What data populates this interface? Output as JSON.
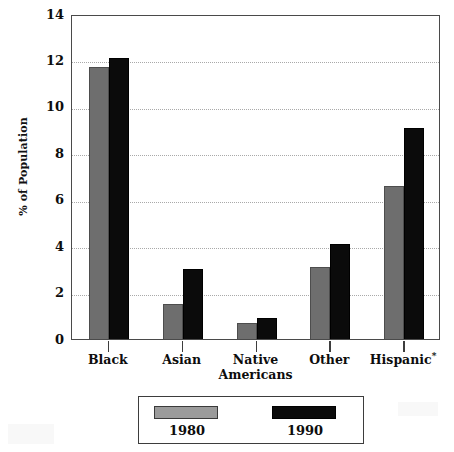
{
  "chart_data": {
    "type": "bar",
    "title": "",
    "xlabel": "",
    "ylabel": "% of Population",
    "ylim": [
      0,
      14
    ],
    "yticks": [
      0,
      2,
      4,
      6,
      8,
      10,
      12,
      14
    ],
    "ytick_labels": [
      "0",
      "2",
      "4",
      "6",
      "8",
      "10",
      "12",
      "14"
    ],
    "grid": true,
    "grid_style": "dotted-horizontal",
    "legend_position": "below-plot",
    "categories": [
      "Black",
      "Asian",
      "Native\nAmericans",
      "Other",
      "Hispanic"
    ],
    "category_notes": {
      "Hispanic": "*"
    },
    "series": [
      {
        "name": "1980",
        "color": "#6e6e6e",
        "values": [
          11.7,
          1.5,
          0.7,
          3.1,
          6.6
        ]
      },
      {
        "name": "1990",
        "color": "#0b0b0b",
        "values": [
          12.1,
          3.0,
          0.9,
          4.1,
          9.1
        ]
      }
    ]
  },
  "legend": {
    "entries": [
      {
        "label": "1980",
        "swatch": "gray-swatch"
      },
      {
        "label": "1990",
        "swatch": "black-swatch"
      }
    ]
  }
}
